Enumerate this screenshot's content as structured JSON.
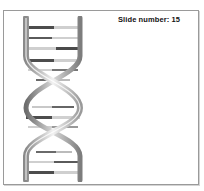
{
  "slide": {
    "number_label": "Slide number: 15",
    "illustration": "dna-double-helix-icon"
  },
  "colors": {
    "frame_border": "#9a9a9a",
    "strand_light": "#e6e6e6",
    "strand_dark": "#7a7a7a",
    "base_dark": "#555555",
    "base_light": "#c8c8c8"
  }
}
